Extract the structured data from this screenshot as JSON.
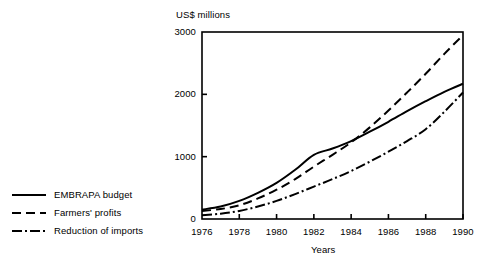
{
  "chart_data": {
    "type": "line",
    "title": "",
    "xlabel": "Years",
    "ylabel": "US$ millions",
    "xlim": [
      1976,
      1990
    ],
    "ylim": [
      0,
      3000
    ],
    "grid": false,
    "legend_position": "left-outside",
    "xticks": [
      "1976",
      "1978",
      "1980",
      "1982",
      "1984",
      "1986",
      "1988",
      "1990"
    ],
    "yticks": [
      "0",
      "1000",
      "2000",
      "3000"
    ],
    "x": [
      1976,
      1977,
      1978,
      1979,
      1980,
      1981,
      1982,
      1983,
      1984,
      1985,
      1986,
      1987,
      1988,
      1989,
      1990
    ],
    "series": [
      {
        "name": "EMBRAPA budget",
        "style": "solid",
        "values": [
          150,
          200,
          290,
          420,
          580,
          790,
          1030,
          1130,
          1250,
          1400,
          1560,
          1730,
          1890,
          2040,
          2170
        ]
      },
      {
        "name": "Farmers' profits",
        "style": "dashed",
        "values": [
          130,
          160,
          220,
          330,
          470,
          640,
          840,
          1030,
          1230,
          1470,
          1740,
          2030,
          2330,
          2650,
          2950
        ]
      },
      {
        "name": "Reduction of imports",
        "style": "dash-dot",
        "values": [
          60,
          85,
          130,
          200,
          290,
          400,
          520,
          640,
          770,
          920,
          1080,
          1250,
          1440,
          1720,
          2030
        ]
      }
    ]
  },
  "legend": {
    "items": [
      {
        "label": "EMBRAPA budget",
        "style": "solid"
      },
      {
        "label": "Farmers' profits",
        "style": "dashed"
      },
      {
        "label": "Reduction of imports",
        "style": "dash-dot"
      }
    ]
  },
  "colors": {
    "line": "#000000",
    "frame": "#000000",
    "background": "#ffffff"
  }
}
